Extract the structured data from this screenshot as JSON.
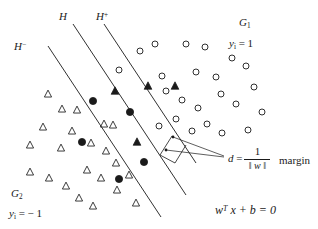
{
  "figure": {
    "width": 318,
    "height": 229,
    "background": "#ffffff",
    "ink_color": "#1a1a1a"
  },
  "labels": {
    "hyperplane_H": "H",
    "hyperplane_Hplus_base": "H",
    "hyperplane_Hplus_sup": "+",
    "hyperplane_Hminus_base": "H",
    "hyperplane_Hminus_sup": "−",
    "group_positive_base": "G",
    "group_positive_sub": "1",
    "group_negative_base": "G",
    "group_negative_sub": "2",
    "label_positive": "y",
    "label_positive_sub": "i",
    "label_positive_value": "= 1",
    "label_negative": "y",
    "label_negative_sub": "i",
    "label_negative_value": "= − 1",
    "margin_word": "margin",
    "distance_symbol": "d",
    "distance_equals": "=",
    "distance_numerator": "1",
    "distance_denominator": "‖ w ‖",
    "hyperplane_equation_w": "w",
    "hyperplane_equation_T": "T",
    "hyperplane_equation_rest": "x + b = 0"
  },
  "boundaries": [
    {
      "name": "H-minus",
      "x1": 48,
      "y1": 46,
      "x2": 161,
      "y2": 217
    },
    {
      "name": "H",
      "x1": 73,
      "y1": 24,
      "x2": 186,
      "y2": 195
    },
    {
      "name": "H-plus",
      "x1": 104,
      "y1": 24,
      "x2": 196,
      "y2": 163
    }
  ],
  "margin_annotation": {
    "bracket": [
      {
        "x1": 172,
        "y1": 136,
        "x2": 160,
        "y2": 155
      },
      {
        "x1": 160,
        "y1": 155,
        "x2": 175,
        "y2": 163
      },
      {
        "x1": 175,
        "y1": 163,
        "x2": 186,
        "y2": 145
      }
    ],
    "dot_upper": {
      "cx": 173,
      "cy": 137
    },
    "dot_mid": {
      "cx": 166,
      "cy": 150
    },
    "leader_upper": {
      "x1": 173,
      "y1": 137,
      "x2": 224,
      "y2": 156
    },
    "leader_lower": {
      "x1": 166,
      "y1": 150,
      "x2": 224,
      "y2": 157
    }
  },
  "chart_data": {
    "type": "scatter",
    "xlabel": "",
    "ylabel": "",
    "grid": false,
    "legend": "none",
    "series": [
      {
        "name": "hollow-circle",
        "class_label": "y_i = 1",
        "marker": "open-circle",
        "points": [
          [
            155,
            44
          ],
          [
            186,
            44
          ],
          [
            205,
            47
          ],
          [
            232,
            58
          ],
          [
            140,
            51
          ],
          [
            162,
            76
          ],
          [
            196,
            72
          ],
          [
            216,
            77
          ],
          [
            166,
            91
          ],
          [
            182,
            100
          ],
          [
            198,
            108
          ],
          [
            221,
            94
          ],
          [
            236,
            104
          ],
          [
            246,
            66
          ],
          [
            254,
            87
          ],
          [
            262,
            112
          ],
          [
            207,
            124
          ],
          [
            192,
            131
          ],
          [
            222,
            133
          ],
          [
            176,
            119
          ],
          [
            248,
            130
          ],
          [
            119,
            70
          ],
          [
            159,
            126
          ]
        ]
      },
      {
        "name": "filled-triangle",
        "class_label": "misclassified (y_i = -1 side)",
        "marker": "filled-triangle",
        "points": [
          [
            115,
            91
          ],
          [
            148,
            86
          ],
          [
            175,
            86
          ],
          [
            137,
            142
          ]
        ]
      },
      {
        "name": "hollow-triangle",
        "class_label": "y_i = -1",
        "marker": "open-triangle",
        "points": [
          [
            48,
            94
          ],
          [
            62,
            109
          ],
          [
            77,
            110
          ],
          [
            43,
            127
          ],
          [
            72,
            131
          ],
          [
            61,
            148
          ],
          [
            91,
            143
          ],
          [
            30,
            145
          ],
          [
            104,
            124
          ],
          [
            106,
            151
          ],
          [
            87,
            170
          ],
          [
            49,
            178
          ],
          [
            66,
            186
          ],
          [
            79,
            198
          ],
          [
            101,
            178
          ],
          [
            116,
            163
          ],
          [
            93,
            206
          ],
          [
            117,
            190
          ],
          [
            129,
            175
          ],
          [
            136,
            203
          ],
          [
            30,
            172
          ],
          [
            113,
            125
          ]
        ]
      },
      {
        "name": "filled-circle",
        "class_label": "misclassified (y_i = 1 side)",
        "marker": "filled-circle",
        "points": [
          [
            93,
            101
          ],
          [
            130,
            112
          ],
          [
            82,
            142
          ],
          [
            144,
            162
          ],
          [
            119,
            179
          ]
        ]
      }
    ]
  }
}
